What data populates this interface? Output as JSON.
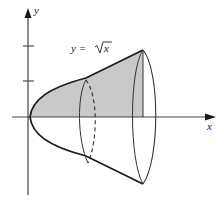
{
  "figure": {
    "type": "solid-of-revolution",
    "equation_label": "y = √x",
    "equation_prefix": "y = ",
    "equation_radicand": "x",
    "axes": {
      "x_label": "x",
      "y_label": "y",
      "y_ticks": 2
    },
    "colors": {
      "shading": "#c9c9c9",
      "curve": "#1a1a1a",
      "axis": "#444444",
      "background": "#ffffff"
    },
    "elements": [
      "y-axis with arrow",
      "x-axis with arrow",
      "parabola curve (paraboloid outline)",
      "shaded region under curve",
      "cross-section ellipse (dashed back)",
      "end ellipse",
      "vertical boundary line"
    ]
  }
}
